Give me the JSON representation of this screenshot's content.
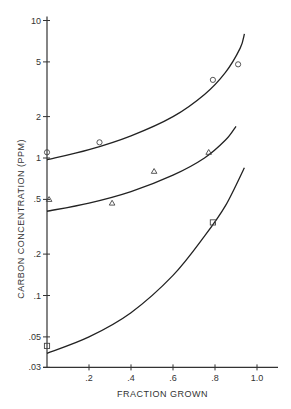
{
  "chart_data": {
    "type": "scatter",
    "title": "",
    "xlabel": "FRACTION GROWN",
    "ylabel": "CARBON CONCENTRATION (PPM)",
    "xlim": [
      0,
      1.1
    ],
    "ylim": [
      0.03,
      10
    ],
    "yscale": "log",
    "grid": false,
    "x_ticks": [
      ".2",
      ".4",
      ".6",
      ".8",
      "1.0"
    ],
    "y_ticks": [
      "10",
      "5",
      "2",
      "1",
      ".5",
      ".2",
      ".1",
      ".05",
      ".03"
    ],
    "series": [
      {
        "name": "circles",
        "marker": "circle",
        "points": [
          [
            0.0,
            1.1
          ],
          [
            0.25,
            1.3
          ],
          [
            0.79,
            3.7
          ],
          [
            0.91,
            4.8
          ]
        ],
        "curve": [
          [
            0,
            0.97
          ],
          [
            0.2,
            1.15
          ],
          [
            0.4,
            1.45
          ],
          [
            0.6,
            2.0
          ],
          [
            0.75,
            2.9
          ],
          [
            0.85,
            4.2
          ],
          [
            0.92,
            6.3
          ],
          [
            0.94,
            8.0
          ]
        ]
      },
      {
        "name": "triangles",
        "marker": "triangle",
        "points": [
          [
            0.01,
            0.5
          ],
          [
            0.31,
            0.47
          ],
          [
            0.51,
            0.8
          ],
          [
            0.77,
            1.1
          ]
        ],
        "curve": [
          [
            0,
            0.41
          ],
          [
            0.2,
            0.47
          ],
          [
            0.4,
            0.57
          ],
          [
            0.6,
            0.75
          ],
          [
            0.75,
            1.0
          ],
          [
            0.85,
            1.35
          ],
          [
            0.9,
            1.7
          ]
        ]
      },
      {
        "name": "squares",
        "marker": "square",
        "points": [
          [
            0.0,
            0.043
          ],
          [
            0.79,
            0.34
          ]
        ],
        "curve": [
          [
            0,
            0.038
          ],
          [
            0.2,
            0.05
          ],
          [
            0.4,
            0.075
          ],
          [
            0.6,
            0.14
          ],
          [
            0.75,
            0.27
          ],
          [
            0.85,
            0.45
          ],
          [
            0.94,
            0.85
          ]
        ]
      }
    ]
  }
}
